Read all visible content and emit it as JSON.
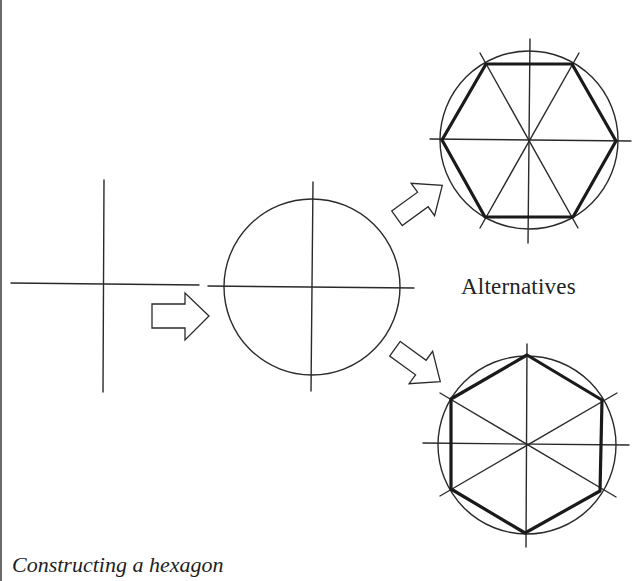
{
  "caption": "Constructing a hexagon",
  "alternatives_label": "Alternatives",
  "colors": {
    "ink": "#2a2a2a",
    "heavy_ink": "#1a1a1a",
    "border": "#6a6a6a",
    "background": "#ffffff"
  },
  "steps": [
    {
      "name": "step-1-crossed-lines",
      "description": "Two perpendicular lines"
    },
    {
      "name": "step-2-circle",
      "description": "Circle drawn at the intersection"
    },
    {
      "name": "step-3a-flat-top-hexagon",
      "description": "Hexagon with flat top and bottom edges"
    },
    {
      "name": "step-3b-pointy-top-hexagon",
      "description": "Hexagon with vertices at top and bottom"
    }
  ]
}
